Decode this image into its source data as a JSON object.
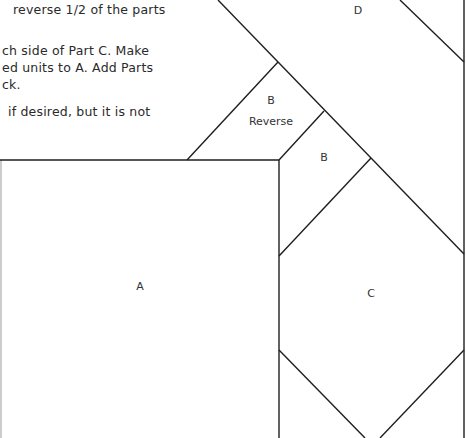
{
  "instructions": {
    "lines": [
      {
        "text": "reverse 1/2 of the parts",
        "top": 1
      },
      {
        "text": "ch side of Part C. Make",
        "top": 42
      },
      {
        "text": "ed units to A. Add Parts",
        "top": 59
      },
      {
        "text": "ck.",
        "top": 76
      },
      {
        "text": "if desired, but it is not",
        "top": 103
      }
    ]
  },
  "pattern": {
    "stroke_color": "#1e1e1e",
    "pieces": [
      {
        "id": "A",
        "label": "A",
        "x": 140,
        "y": 280
      },
      {
        "id": "B-reverse",
        "label": "B",
        "sublabel": "Reverse",
        "x": 271,
        "y": 102
      },
      {
        "id": "B",
        "label": "B",
        "x": 324,
        "y": 159
      },
      {
        "id": "C",
        "label": "C",
        "x": 371,
        "y": 294
      },
      {
        "id": "D",
        "label": "D",
        "x": 358,
        "y": 6
      }
    ]
  }
}
